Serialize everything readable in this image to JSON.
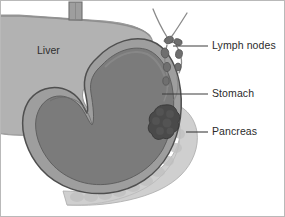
{
  "figure": {
    "width": 285,
    "height": 217,
    "background": "#ffffff",
    "border_color": "#b9b9b9"
  },
  "labels": {
    "liver": "Liver",
    "lymph_nodes": "Lymph nodes",
    "stomach": "Stomach",
    "pancreas": "Pancreas"
  },
  "colors": {
    "liver_fill": "#b2b2b2",
    "liver_edge": "#8e8e8e",
    "stomach_fill": "#7b7b7b",
    "stomach_wall": "#9e9e9e",
    "stomach_outline": "#4f4f4f",
    "pancreas_fill": "#cfcfcf",
    "pancreas_edge": "#a8a8a8",
    "tumor_fill": "#4a4a4a",
    "tumor_edge": "#3a3a3a",
    "lymph_vessel": "#8a8a8a",
    "lymph_node_fill": "#6f6f6f",
    "esophagus_fill": "#9a9a9a",
    "esophagus_edge": "#6e6e6e",
    "leader_line": "#3c3c3c",
    "text": "#2b2b2b"
  },
  "callouts": [
    {
      "id": "lymph-nodes",
      "label": "Lymph nodes",
      "text_x": 211,
      "text_y": 39,
      "leader_from_x": 203,
      "leader_from_y": 45,
      "leader_to_x": 172,
      "leader_to_y": 45
    },
    {
      "id": "stomach",
      "label": "Stomach",
      "text_x": 211,
      "text_y": 87,
      "leader_from_x": 203,
      "leader_from_y": 93,
      "leader_to_x": 161,
      "leader_to_y": 93
    },
    {
      "id": "pancreas",
      "label": "Pancreas",
      "text_x": 211,
      "text_y": 125,
      "leader_from_x": 203,
      "leader_from_y": 131,
      "leader_to_x": 185,
      "leader_to_y": 131
    }
  ],
  "organs": [
    {
      "id": "liver",
      "name": "Liver",
      "interactable": false
    },
    {
      "id": "esophagus",
      "name": "Esophagus",
      "interactable": false
    },
    {
      "id": "stomach",
      "name": "Stomach",
      "interactable": false
    },
    {
      "id": "pancreas",
      "name": "Pancreas",
      "interactable": false
    },
    {
      "id": "lymph-nodes",
      "name": "Lymph nodes",
      "interactable": false
    },
    {
      "id": "tumor-mass",
      "name": "Tumor mass",
      "interactable": false
    }
  ]
}
